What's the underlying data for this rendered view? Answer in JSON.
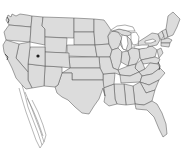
{
  "map": {
    "title": "Contiguous United States",
    "type": "choropleth-outline",
    "projection_note": "Albers-like, lower 48 states",
    "background_color": "#ffffff",
    "land_fill_color": "#dcdcdc",
    "border_color": "#595959",
    "outline_color": "#3a3a3a",
    "lake_fill_color": "#ffffff",
    "marker_color": "#1d1d1d",
    "state_count": 49,
    "markers": [
      {
        "name": "utah-marker",
        "label": "",
        "x": 38,
        "y": 56,
        "color": "#1d1d1d"
      }
    ],
    "features": [
      {
        "name": "great-lakes",
        "label": ""
      },
      {
        "name": "florida-peninsula",
        "label": ""
      },
      {
        "name": "chesapeake-bay",
        "label": ""
      },
      {
        "name": "puget-sound",
        "label": ""
      },
      {
        "name": "san-francisco-bay",
        "label": ""
      },
      {
        "name": "baja-artifact-streaks",
        "label": ""
      }
    ],
    "legend": {
      "visible": false,
      "entries": []
    },
    "labels_visible": false
  }
}
